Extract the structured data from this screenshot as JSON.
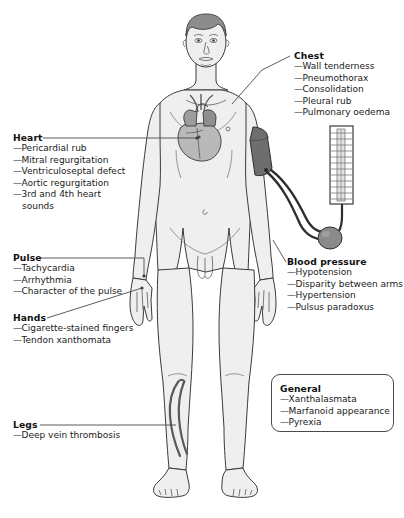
{
  "figure": {
    "colors": {
      "skin_fill": "#efefef",
      "outline": "#3a3a3a",
      "hair": "#8c8c8c",
      "heart_fill": "#b9b9b9",
      "heart_dark": "#7d7d7d",
      "cuff_fill": "#6e6e6e",
      "bulb_fill": "#8a8a8a",
      "tube": "#2e2e2e",
      "vein": "#5a5a5a",
      "leader_line": "#4a4a4a",
      "box_border": "#4a4a4a",
      "text": "#1a1a1a",
      "background": "#ffffff"
    }
  },
  "callouts": {
    "chest": {
      "title": "Chest",
      "items": [
        "Wall tenderness",
        "Pneumothorax",
        "Consolidation",
        "Pleural rub",
        "Pulmonary oedema"
      ]
    },
    "heart": {
      "title": "Heart",
      "items": [
        "Pericardial rub",
        "Mitral regurgitation",
        "Ventriculoseptal defect",
        "Aortic regurgitation",
        "3rd and 4th heart"
      ],
      "continuation": "sounds"
    },
    "pulse": {
      "title": "Pulse",
      "items": [
        "Tachycardia",
        "Arrhythmia",
        "Character of the pulse"
      ]
    },
    "hands": {
      "title": "Hands",
      "items": [
        "Cigarette-stained fingers",
        "Tendon xanthomata"
      ]
    },
    "blood_pressure": {
      "title": "Blood pressure",
      "items": [
        "Hypotension",
        "Disparity between arms",
        "Hypertension",
        "Pulsus paradoxus"
      ]
    },
    "general": {
      "title": "General",
      "items": [
        "Xanthalasmata",
        "Marfanoid appearance",
        "Pyrexia"
      ]
    },
    "legs": {
      "title": "Legs",
      "items": [
        "Deep vein thrombosis"
      ]
    }
  },
  "icons": {
    "body": "human-body-anterior-icon",
    "heart": "heart-organ-icon",
    "cuff": "blood-pressure-cuff-icon",
    "manometer": "sphygmomanometer-column-icon",
    "bulb": "inflation-bulb-icon",
    "vein": "leg-vein-icon"
  },
  "caption": {
    "text": ""
  },
  "dash": "—"
}
